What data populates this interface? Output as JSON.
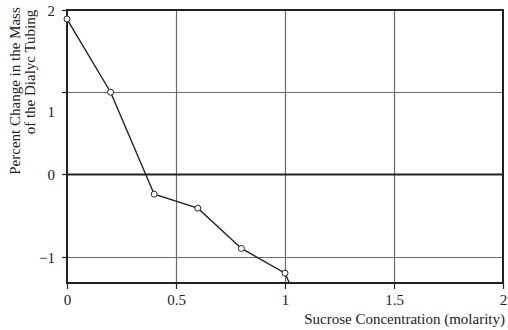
{
  "chart_data": {
    "type": "line",
    "title": "",
    "xlabel": "Sucrose Concentration (molarity)",
    "ylabel": [
      "Percent Change in the Mass",
      "of the Dialyc Tubing"
    ],
    "x": [
      0,
      0.2,
      0.4,
      0.6,
      0.8,
      1.0
    ],
    "series": [
      {
        "name": "Percent Change in Mass",
        "values": [
          1.89,
          1.0,
          -0.24,
          -0.41,
          -0.9,
          -1.2
        ],
        "marker": "open-circle",
        "extends_to": {
          "x": 1.02,
          "y": -1.32
        }
      }
    ],
    "xlim": [
      0,
      2
    ],
    "ylim": [
      -1.32,
      2
    ],
    "xticks": [
      0,
      0.5,
      1,
      1.5,
      2
    ],
    "xtick_labels": [
      "0",
      "0.5",
      "1",
      "1.5",
      "2"
    ],
    "yticks": [
      2,
      1,
      0,
      -1
    ],
    "ytick_labels": [
      "2",
      "1",
      "0",
      "−1"
    ],
    "grid": true,
    "legend": "none"
  },
  "colors": {
    "line": "#222222",
    "axis": "#222222",
    "grid": "#6a6a6a",
    "zero_line": "#222222",
    "marker_fill": "#ffffff",
    "text": "#222222"
  },
  "layout": {
    "plot_left": 67,
    "plot_right": 503,
    "plot_top": 10,
    "plot_bottom": 283
  }
}
